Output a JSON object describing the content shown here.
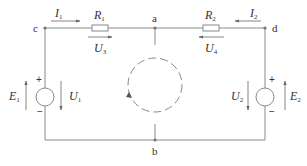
{
  "diagram": {
    "type": "electrical-circuit",
    "colors": {
      "wire": "#8a8a8a",
      "text": "#333333",
      "background": "#ffffff"
    },
    "nodes": [
      {
        "id": "a",
        "label": "a"
      },
      {
        "id": "b",
        "label": "b"
      },
      {
        "id": "c",
        "label": "c"
      },
      {
        "id": "d",
        "label": "d"
      }
    ],
    "resistors": [
      {
        "id": "R1",
        "main": "R",
        "sub": "1",
        "between": [
          "c",
          "a"
        ]
      },
      {
        "id": "R2",
        "main": "R",
        "sub": "2",
        "between": [
          "a",
          "d"
        ]
      }
    ],
    "sources": [
      {
        "id": "E1",
        "main": "E",
        "sub": "1",
        "plus": "+",
        "minus": "−",
        "side": "left"
      },
      {
        "id": "E2",
        "main": "E",
        "sub": "2",
        "plus": "+",
        "minus": "−",
        "side": "right"
      }
    ],
    "currents": [
      {
        "id": "I1",
        "main": "I",
        "sub": "1",
        "direction": "right"
      },
      {
        "id": "I2",
        "main": "I",
        "sub": "2",
        "direction": "left"
      }
    ],
    "voltages": [
      {
        "id": "U1",
        "main": "U",
        "sub": "1",
        "direction": "down"
      },
      {
        "id": "U2",
        "main": "U",
        "sub": "2",
        "direction": "down"
      },
      {
        "id": "U3",
        "main": "U",
        "sub": "3",
        "direction": "right"
      },
      {
        "id": "U4",
        "main": "U",
        "sub": "4",
        "direction": "left"
      }
    ],
    "loop": {
      "style": "dashed",
      "direction": "counter-clockwise"
    }
  }
}
